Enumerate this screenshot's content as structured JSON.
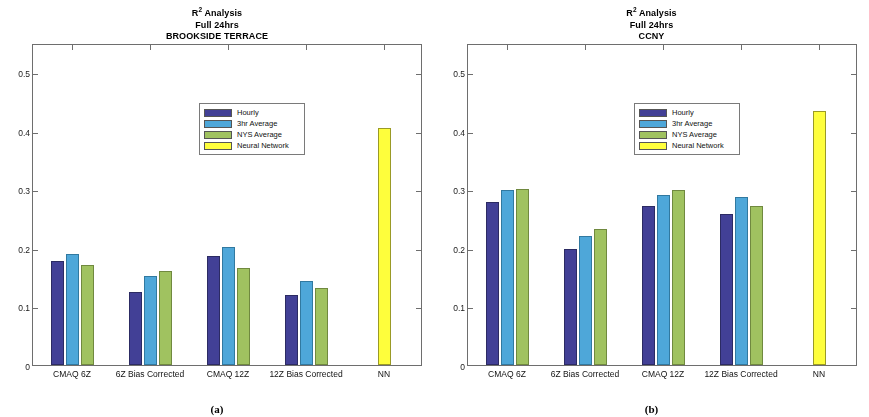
{
  "figure": {
    "panels": [
      {
        "key": "a",
        "caption": "(a)",
        "title_line1": "R",
        "title_sup": "2",
        "title_line1b": " Analysis",
        "title_line2": "Full 24hrs",
        "title_line3": "BROOKSIDE TERRACE"
      },
      {
        "key": "b",
        "caption": "(b)",
        "title_line1": "R",
        "title_sup": "2",
        "title_line1b": " Analysis",
        "title_line2": "Full 24hrs",
        "title_line3": "CCNY"
      }
    ],
    "legend": {
      "items": [
        {
          "label": "Hourly",
          "color": "#42409a"
        },
        {
          "label": "3hr Average",
          "color": "#4aa8dc"
        },
        {
          "label": "NYS Average",
          "color": "#9fc35c"
        },
        {
          "label": "Neural Network",
          "color": "#ffff33"
        }
      ]
    }
  },
  "chart_data": [
    {
      "type": "bar",
      "panel": "(a)",
      "title": "R2 Analysis Full 24hrs BROOKSIDE TERRACE",
      "xlabel": "",
      "ylabel": "",
      "ylim": [
        0,
        0.55
      ],
      "yticks": [
        0,
        0.1,
        0.2,
        0.3,
        0.4,
        0.5
      ],
      "ytick_labels": [
        "0",
        "0.1",
        "0.2",
        "0.3",
        "0.4",
        "0.5"
      ],
      "grid": false,
      "legend_position": "upper center",
      "categories": [
        "CMAQ 6Z",
        "6Z Bias Corrected",
        "CMAQ 12Z",
        "12Z Bias Corrected",
        "NN"
      ],
      "series": [
        {
          "name": "Hourly",
          "color": "#42409a",
          "values": [
            0.178,
            0.124,
            0.186,
            0.119,
            null
          ]
        },
        {
          "name": "3hr Average",
          "color": "#4aa8dc",
          "values": [
            0.189,
            0.152,
            0.201,
            0.144,
            null
          ]
        },
        {
          "name": "NYS Average",
          "color": "#9fc35c",
          "values": [
            0.171,
            0.161,
            0.166,
            0.131,
            null
          ]
        },
        {
          "name": "Neural Network",
          "color": "#ffff33",
          "values": [
            null,
            null,
            null,
            null,
            0.405
          ]
        }
      ]
    },
    {
      "type": "bar",
      "panel": "(b)",
      "title": "R2 Analysis Full 24hrs CCNY",
      "xlabel": "",
      "ylabel": "",
      "ylim": [
        0,
        0.55
      ],
      "yticks": [
        0,
        0.1,
        0.2,
        0.3,
        0.4,
        0.5
      ],
      "ytick_labels": [
        "0",
        "0.1",
        "0.2",
        "0.3",
        "0.4",
        "0.5"
      ],
      "grid": false,
      "legend_position": "upper center",
      "categories": [
        "CMAQ 6Z",
        "6Z Bias Corrected",
        "CMAQ 12Z",
        "12Z Bias Corrected",
        "NN"
      ],
      "series": [
        {
          "name": "Hourly",
          "color": "#42409a",
          "values": [
            0.279,
            0.199,
            0.272,
            0.258,
            null
          ]
        },
        {
          "name": "3hr Average",
          "color": "#4aa8dc",
          "values": [
            0.299,
            0.221,
            0.291,
            0.287,
            null
          ]
        },
        {
          "name": "NYS Average",
          "color": "#9fc35c",
          "values": [
            0.3,
            0.232,
            0.299,
            0.272,
            null
          ]
        },
        {
          "name": "Neural Network",
          "color": "#ffff33",
          "values": [
            null,
            null,
            null,
            null,
            0.434
          ]
        }
      ]
    }
  ]
}
